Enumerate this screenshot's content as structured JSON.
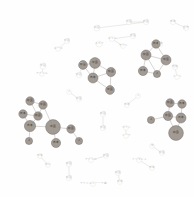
{
  "figure": {
    "type": "network-graph",
    "title": "",
    "background_color": "#fefefe",
    "edge_color": "#c9c6c2",
    "faint_node_stroke": "#d8d5d1",
    "dark_node_fill": "#8c8madd",
    "layout": "circular force-directed cluster layout"
  },
  "chart_data": {
    "type": "scatter",
    "title": "",
    "xlabel": "",
    "ylabel": "",
    "legend": [],
    "nodes": [
      {
        "id": "n1",
        "label": "中国",
        "x": 129,
        "y": 22,
        "r": 2.6,
        "style": "faint"
      },
      {
        "id": "n2",
        "label": "韓国",
        "x": 146,
        "y": 22,
        "r": 2.6,
        "style": "faint"
      },
      {
        "id": "n3",
        "label": "日本",
        "x": 173,
        "y": 22,
        "r": 2.6,
        "style": "faint"
      },
      {
        "id": "n4",
        "label": "台湾",
        "x": 186,
        "y": 28,
        "r": 2.6,
        "style": "faint"
      },
      {
        "id": "n5",
        "label": "韓国",
        "x": 97,
        "y": 28,
        "r": 3.0,
        "style": "faint"
      },
      {
        "id": "n6",
        "label": "米国",
        "x": 133,
        "y": 36,
        "r": 2.6,
        "style": "faint"
      },
      {
        "id": "n7",
        "label": "ネット",
        "x": 112,
        "y": 39,
        "r": 2.6,
        "style": "faint"
      },
      {
        "id": "n8",
        "label": "スカイ",
        "x": 99,
        "y": 44,
        "r": 3.0,
        "style": "faint"
      },
      {
        "id": "n9",
        "label": "中国",
        "x": 67,
        "y": 41,
        "r": 2.6,
        "style": "faint"
      },
      {
        "id": "n10",
        "label": "ネース",
        "x": 58,
        "y": 49,
        "r": 2.4,
        "style": "faint"
      },
      {
        "id": "n11",
        "label": "サイト",
        "x": 123,
        "y": 46,
        "r": 2.4,
        "style": "faint"
      },
      {
        "id": "n12",
        "label": "日本",
        "x": 160,
        "y": 44,
        "r": 2.6,
        "style": "faint"
      },
      {
        "id": "n13",
        "label": "米国",
        "x": 43,
        "y": 66,
        "r": 3.0,
        "style": "faint"
      },
      {
        "id": "n14",
        "label": "アイドル",
        "x": 42,
        "y": 74,
        "r": 2.4,
        "style": "faint"
      },
      {
        "id": "n15",
        "label": "日本",
        "x": 83,
        "y": 64,
        "r": 2.6,
        "style": "faint"
      },
      {
        "id": "n16",
        "label": "韓国",
        "x": 79,
        "y": 75,
        "r": 2.8,
        "style": "faint"
      },
      {
        "id": "n17",
        "label": "地域",
        "x": 175,
        "y": 67,
        "r": 2.6,
        "style": "faint"
      },
      {
        "id": "n18",
        "label": "ニート",
        "x": 177,
        "y": 77,
        "r": 2.4,
        "style": "faint"
      },
      {
        "id": "n19",
        "label": "人",
        "x": 69,
        "y": 92,
        "r": 2.4,
        "style": "faint"
      },
      {
        "id": "n20",
        "label": "韓国",
        "x": 79,
        "y": 99,
        "r": 2.4,
        "style": "faint"
      },
      {
        "id": "n21",
        "label": "人",
        "x": 138,
        "y": 96,
        "r": 2.4,
        "style": "faint"
      },
      {
        "id": "n22",
        "label": "日本",
        "x": 127,
        "y": 105,
        "r": 2.4,
        "style": "faint"
      },
      {
        "id": "n23",
        "label": "韓国",
        "x": 103,
        "y": 114,
        "r": 2.6,
        "style": "faint"
      },
      {
        "id": "n24",
        "label": "中国",
        "x": 103,
        "y": 128,
        "r": 2.6,
        "style": "faint"
      },
      {
        "id": "n25",
        "label": "カイト",
        "x": 126,
        "y": 128,
        "r": 2.4,
        "style": "faint"
      },
      {
        "id": "n26",
        "label": "トーク",
        "x": 126,
        "y": 136,
        "r": 2.4,
        "style": "faint"
      },
      {
        "id": "n27",
        "label": "米",
        "x": 152,
        "y": 146,
        "r": 2.4,
        "style": "faint"
      },
      {
        "id": "n28",
        "label": "韓国",
        "x": 162,
        "y": 153,
        "r": 2.4,
        "style": "faint"
      },
      {
        "id": "n29",
        "label": "日本",
        "x": 40,
        "y": 156,
        "r": 2.4,
        "style": "faint"
      },
      {
        "id": "n30",
        "label": "中に",
        "x": 48,
        "y": 165,
        "r": 2.4,
        "style": "faint"
      },
      {
        "id": "n31",
        "label": "韓国",
        "x": 69,
        "y": 164,
        "r": 2.6,
        "style": "faint"
      },
      {
        "id": "n32",
        "label": "韓国",
        "x": 69,
        "y": 178,
        "r": 2.6,
        "style": "faint"
      },
      {
        "id": "n33",
        "label": "アイドル",
        "x": 91,
        "y": 160,
        "r": 2.6,
        "style": "faint"
      },
      {
        "id": "n34",
        "label": "韓国",
        "x": 106,
        "y": 156,
        "r": 2.4,
        "style": "faint"
      },
      {
        "id": "n35",
        "label": "インタビュ",
        "x": 139,
        "y": 160,
        "r": 2.6,
        "style": "faint"
      },
      {
        "id": "n36",
        "label": "日本",
        "x": 152,
        "y": 168,
        "r": 2.4,
        "style": "faint"
      },
      {
        "id": "n37",
        "label": "韓国",
        "x": 118,
        "y": 173,
        "r": 2.4,
        "style": "faint"
      },
      {
        "id": "n38",
        "label": "日本",
        "x": 120,
        "y": 182,
        "r": 2.4,
        "style": "faint"
      },
      {
        "id": "n39",
        "label": "アイドルトーーク曲",
        "x": 93,
        "y": 184,
        "r": 2.4,
        "style": "faint"
      },
      {
        "id": "c1a",
        "label": "韓国",
        "x": 83,
        "y": 65,
        "r": 4.4,
        "style": "dark"
      },
      {
        "id": "c1b",
        "label": "中国",
        "x": 95,
        "y": 63,
        "r": 5.4,
        "style": "dark"
      },
      {
        "id": "c1c",
        "label": "日本",
        "x": 93,
        "y": 78,
        "r": 5.0,
        "style": "dark"
      },
      {
        "id": "c1d",
        "label": "韓国",
        "x": 111,
        "y": 72,
        "r": 4.6,
        "style": "dark"
      },
      {
        "id": "c1e",
        "label": "中国",
        "x": 110,
        "y": 90,
        "r": 4.4,
        "style": "dark"
      },
      {
        "id": "c2a",
        "label": "日本",
        "x": 156,
        "y": 44,
        "r": 4.2,
        "style": "dark"
      },
      {
        "id": "c2b",
        "label": "韓国",
        "x": 146,
        "y": 55,
        "r": 5.0,
        "style": "dark"
      },
      {
        "id": "c2c",
        "label": "中国",
        "x": 166,
        "y": 60,
        "r": 5.0,
        "style": "dark"
      },
      {
        "id": "c2d",
        "label": "日本",
        "x": 143,
        "y": 71,
        "r": 4.6,
        "style": "dark"
      },
      {
        "id": "c2e",
        "label": "人",
        "x": 157,
        "y": 74,
        "r": 3.6,
        "style": "dark"
      },
      {
        "id": "c3a",
        "label": "韓国",
        "x": 30,
        "y": 101,
        "r": 4.2,
        "style": "dark"
      },
      {
        "id": "c3b",
        "label": "中国",
        "x": 43,
        "y": 105,
        "r": 4.2,
        "style": "dark"
      },
      {
        "id": "c3c",
        "label": "日本",
        "x": 23,
        "y": 114,
        "r": 4.2,
        "style": "dark"
      },
      {
        "id": "c3d",
        "label": "韓国",
        "x": 38,
        "y": 116,
        "r": 4.2,
        "style": "dark"
      },
      {
        "id": "c3e",
        "label": "日本",
        "x": 30,
        "y": 126,
        "r": 5.6,
        "style": "dark"
      },
      {
        "id": "c3f",
        "label": "中国",
        "x": 53,
        "y": 127,
        "r": 7.4,
        "style": "dark"
      },
      {
        "id": "c3g",
        "label": "人",
        "x": 29,
        "y": 141,
        "r": 3.6,
        "style": "dark"
      },
      {
        "id": "c3h",
        "label": "日本",
        "x": 56,
        "y": 143,
        "r": 4.6,
        "style": "dark"
      },
      {
        "id": "c3i",
        "label": "韓国",
        "x": 71,
        "y": 129,
        "r": 4.2,
        "style": "dark"
      },
      {
        "id": "c3j",
        "label": "人",
        "x": 79,
        "y": 141,
        "r": 3.6,
        "style": "dark"
      },
      {
        "id": "c4a",
        "label": "韓国",
        "x": 170,
        "y": 103,
        "r": 4.2,
        "style": "dark"
      },
      {
        "id": "c4b",
        "label": "日本",
        "x": 182,
        "y": 104,
        "r": 4.2,
        "style": "dark"
      },
      {
        "id": "c4c",
        "label": "中国",
        "x": 168,
        "y": 116,
        "r": 4.6,
        "style": "dark"
      },
      {
        "id": "c4d",
        "label": "日本",
        "x": 181,
        "y": 118,
        "r": 5.0,
        "style": "dark"
      },
      {
        "id": "c4e",
        "label": "人",
        "x": 151,
        "y": 120,
        "r": 3.6,
        "style": "dark"
      },
      {
        "id": "c4f",
        "label": "韓国",
        "x": 176,
        "y": 133,
        "r": 7.4,
        "style": "dark"
      }
    ],
    "edges": [
      {
        "source": "n1",
        "target": "n2"
      },
      {
        "source": "n2",
        "target": "n5"
      },
      {
        "source": "n3",
        "target": "n4"
      },
      {
        "source": "n6",
        "target": "n7"
      },
      {
        "source": "n7",
        "target": "n11"
      },
      {
        "source": "n9",
        "target": "n10"
      },
      {
        "source": "n13",
        "target": "n14"
      },
      {
        "source": "n15",
        "target": "n16"
      },
      {
        "source": "n17",
        "target": "n18"
      },
      {
        "source": "n19",
        "target": "n20"
      },
      {
        "source": "n21",
        "target": "n22"
      },
      {
        "source": "n23",
        "target": "n24"
      },
      {
        "source": "n25",
        "target": "n26"
      },
      {
        "source": "n27",
        "target": "n28"
      },
      {
        "source": "n29",
        "target": "n30"
      },
      {
        "source": "n31",
        "target": "n32"
      },
      {
        "source": "n33",
        "target": "n34"
      },
      {
        "source": "n35",
        "target": "n36"
      },
      {
        "source": "n37",
        "target": "n38"
      },
      {
        "source": "c1a",
        "target": "c1b"
      },
      {
        "source": "c1a",
        "target": "c1c"
      },
      {
        "source": "c1b",
        "target": "c1c"
      },
      {
        "source": "c1b",
        "target": "c1d"
      },
      {
        "source": "c1c",
        "target": "c1d"
      },
      {
        "source": "c1c",
        "target": "c1e"
      },
      {
        "source": "c1d",
        "target": "c1e"
      },
      {
        "source": "c2a",
        "target": "c2b"
      },
      {
        "source": "c2a",
        "target": "c2c"
      },
      {
        "source": "c2b",
        "target": "c2c"
      },
      {
        "source": "c2b",
        "target": "c2d"
      },
      {
        "source": "c2c",
        "target": "c2e"
      },
      {
        "source": "c2d",
        "target": "c2e"
      },
      {
        "source": "c2b",
        "target": "c2e"
      },
      {
        "source": "c3a",
        "target": "c3b"
      },
      {
        "source": "c3a",
        "target": "c3d"
      },
      {
        "source": "c3b",
        "target": "c3d"
      },
      {
        "source": "c3c",
        "target": "c3d"
      },
      {
        "source": "c3c",
        "target": "c3e"
      },
      {
        "source": "c3d",
        "target": "c3e"
      },
      {
        "source": "c3e",
        "target": "c3f"
      },
      {
        "source": "c3e",
        "target": "c3g"
      },
      {
        "source": "c3f",
        "target": "c3h"
      },
      {
        "source": "c3f",
        "target": "c3i"
      },
      {
        "source": "c3b",
        "target": "c3f"
      },
      {
        "source": "c3i",
        "target": "c3j"
      },
      {
        "source": "c4a",
        "target": "c4b"
      },
      {
        "source": "c4a",
        "target": "c4c"
      },
      {
        "source": "c4b",
        "target": "c4d"
      },
      {
        "source": "c4c",
        "target": "c4d"
      },
      {
        "source": "c4c",
        "target": "c4e"
      },
      {
        "source": "c4c",
        "target": "c4f"
      },
      {
        "source": "c4d",
        "target": "c4f"
      }
    ]
  }
}
